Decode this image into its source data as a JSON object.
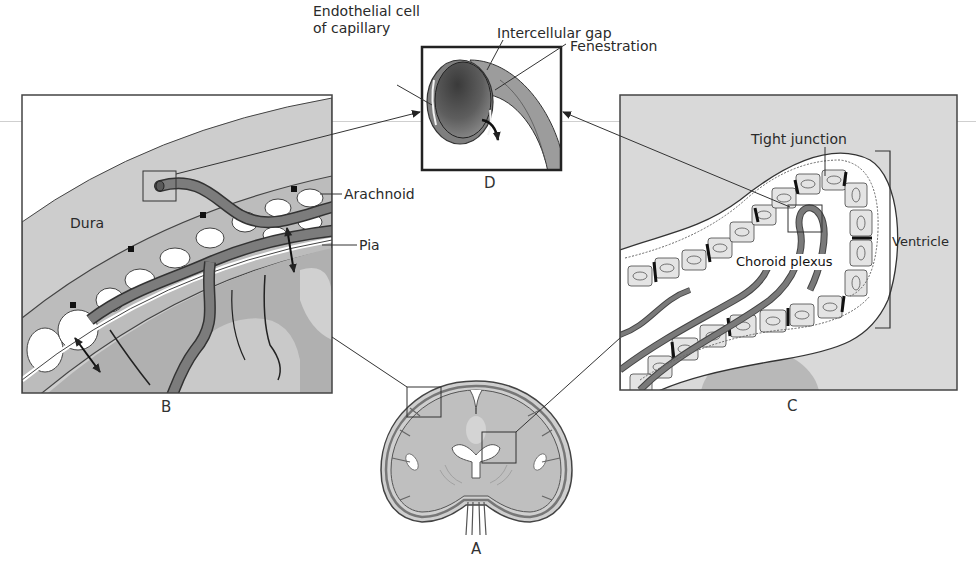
{
  "figure": {
    "panels": [
      {
        "id": "A",
        "letter": "A",
        "description": "Coronal section of brain with two inset boxes"
      },
      {
        "id": "B",
        "letter": "B",
        "description": "Meninges and cortical vessels"
      },
      {
        "id": "C",
        "letter": "C",
        "description": "Choroid plexus in ventricle"
      },
      {
        "id": "D",
        "letter": "D",
        "description": "Capillary cross-section"
      }
    ]
  },
  "labels": {
    "endothelial_line1": "Endothelial cell",
    "endothelial_line2": "of capillary",
    "intercellular_gap": "Intercellular gap",
    "fenestration": "Fenestration",
    "dura": "Dura",
    "arachnoid": "Arachnoid",
    "pia": "Pia",
    "tight_junction": "Tight junction",
    "ventricle": "Ventricle",
    "choroid_plexus": "Choroid plexus"
  },
  "letters": {
    "A": "A",
    "B": "B",
    "C": "C",
    "D": "D"
  },
  "colors": {
    "background": "#ffffff",
    "panel_fill": "#d9d9d9",
    "dura_fill": "#cfcfcf",
    "brain_fill": "#bdbdbd",
    "brain_light": "#d2d2d2",
    "vessel": "#7a7a7a",
    "outline": "#333333",
    "cell_fill": "#e6e6e6"
  }
}
